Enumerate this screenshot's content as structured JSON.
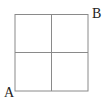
{
  "diagram": {
    "type": "grid",
    "rows": 2,
    "cols": 2,
    "line_color": "#888888",
    "labels": {
      "start": "A",
      "end": "B"
    }
  }
}
